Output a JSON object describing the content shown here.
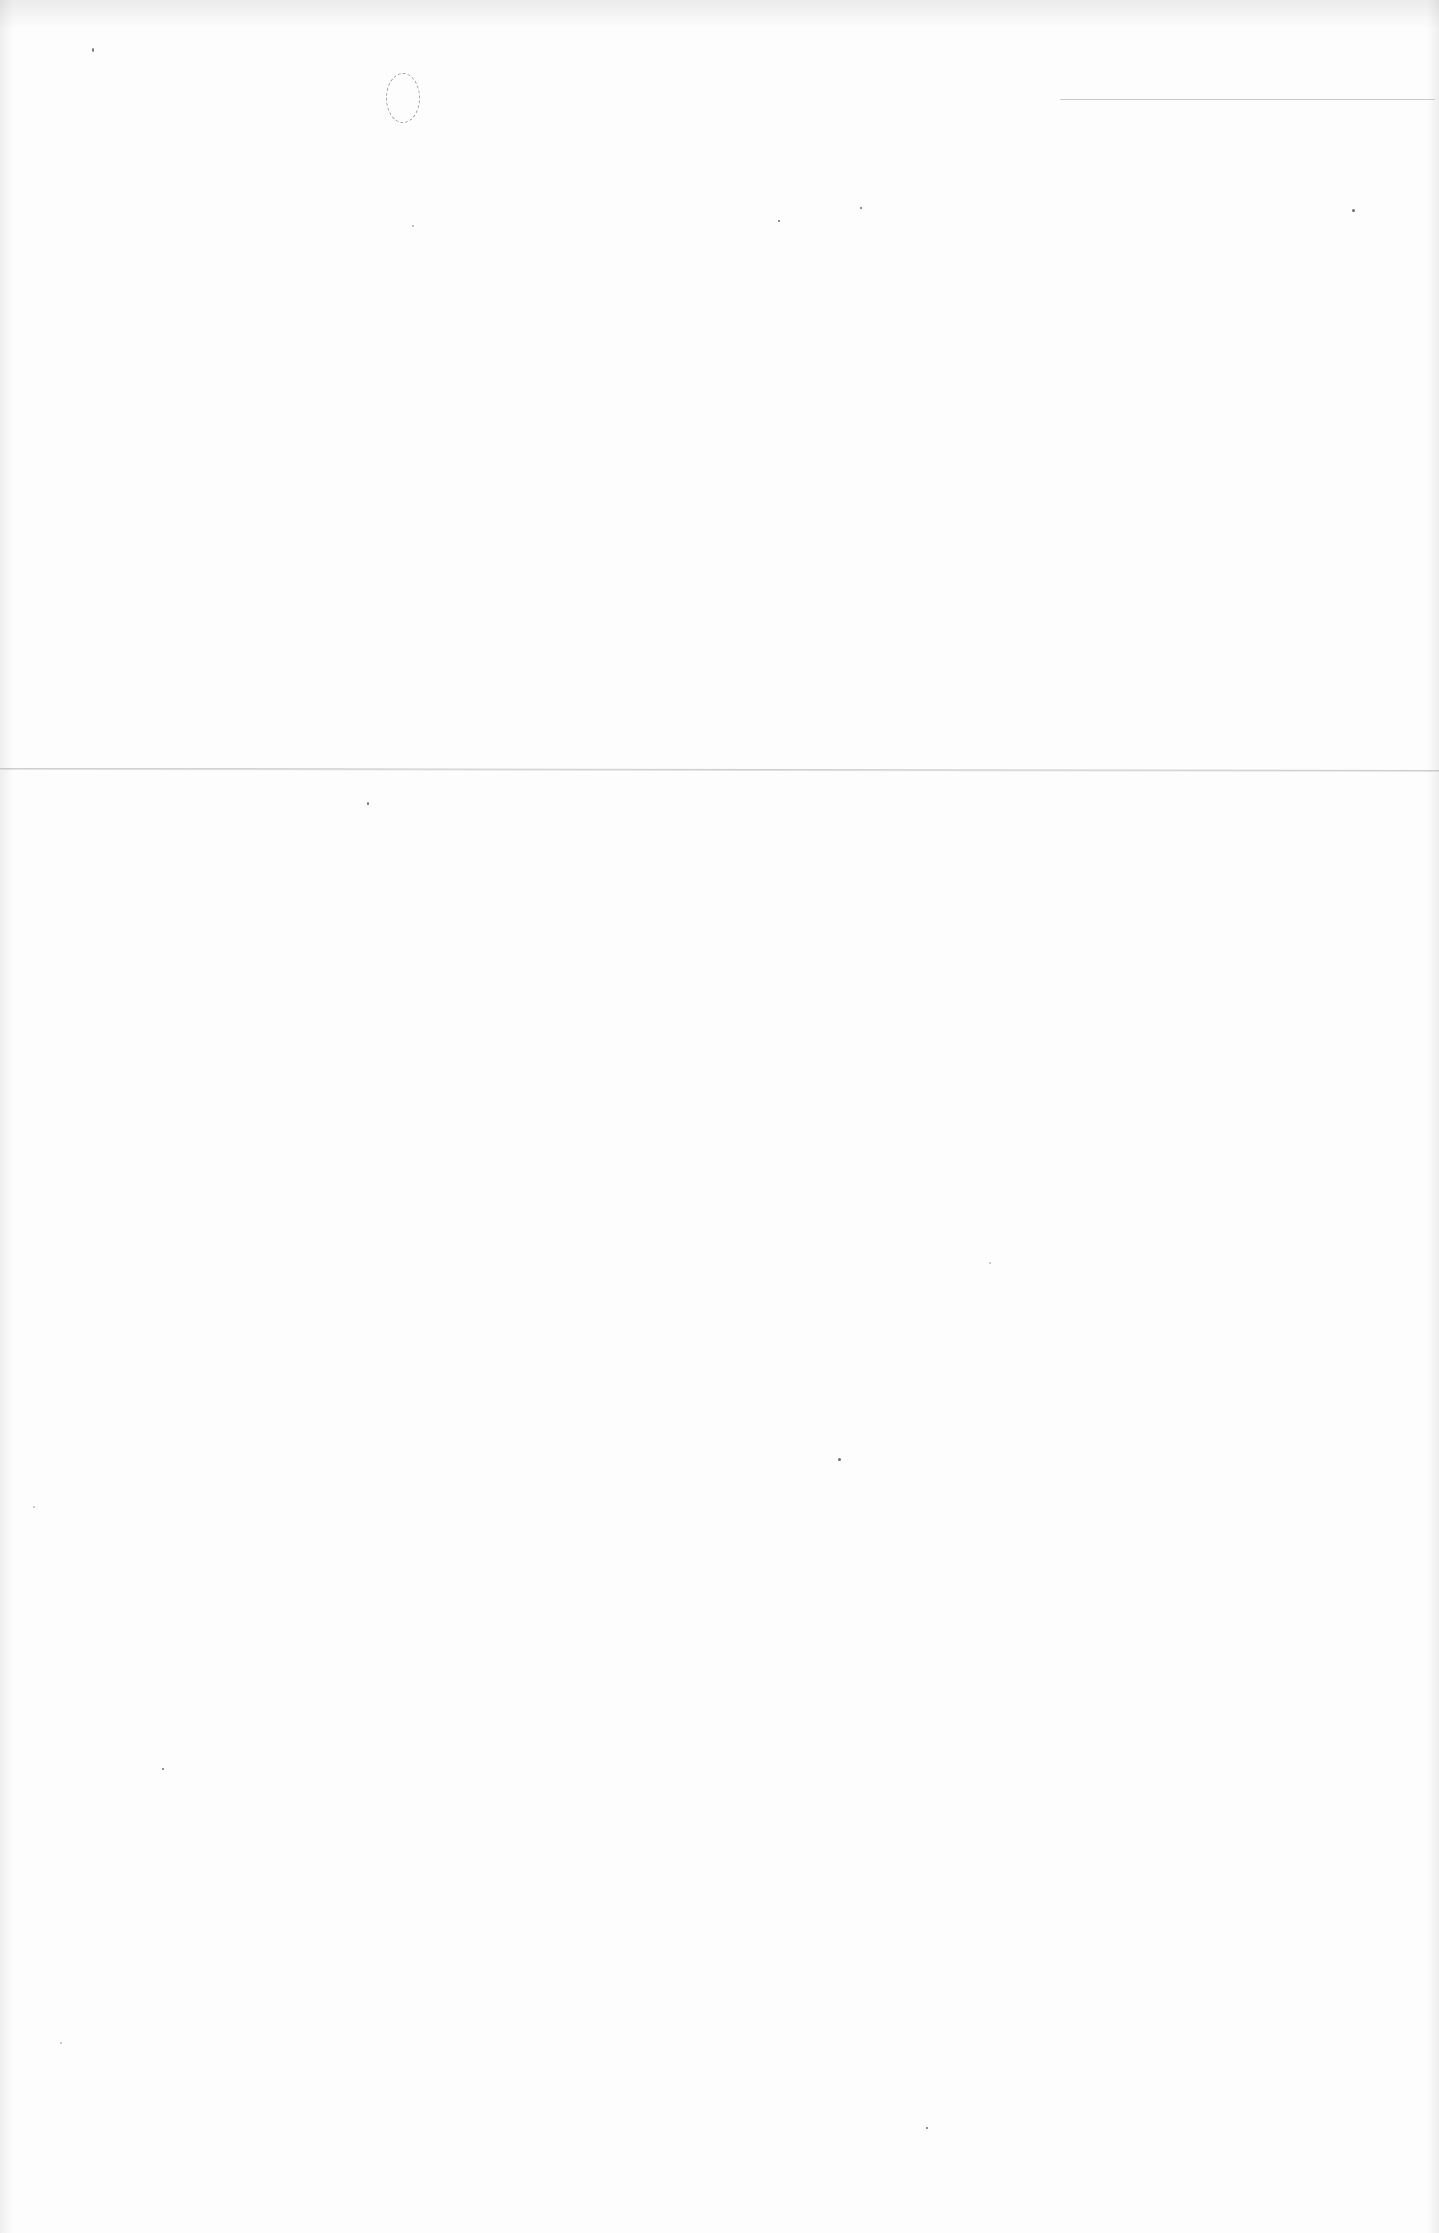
{
  "document": {
    "description": "Blank scanned paper page",
    "text_content": "",
    "marks": {
      "fold_line": {
        "y": 770,
        "color": "#a8a8a8"
      },
      "top_rule": {
        "x_start": 1060,
        "x_end": 1435,
        "y": 99,
        "color": "#b5b5b5"
      },
      "pencil_circle": {
        "x": 386,
        "y": 73,
        "width": 32,
        "height": 48
      }
    },
    "background_color": "#fdfdfd"
  }
}
